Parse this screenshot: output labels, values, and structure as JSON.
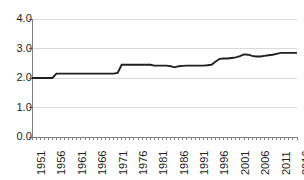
{
  "chart_data": {
    "type": "line",
    "title": "",
    "subtitle": "",
    "xlabel": "",
    "ylabel": "",
    "xlim": [
      1951,
      2016
    ],
    "ylim": [
      0.0,
      4.0
    ],
    "grid": "horizontal",
    "legend": "none",
    "line_color": "#231f20",
    "gridline_color": "#d9d9d9",
    "axis_color": "#808080",
    "y_ticks": [
      "0.0",
      "1.0",
      "2.0",
      "3.0",
      "4.0"
    ],
    "y_tick_values": [
      0.0,
      1.0,
      2.0,
      3.0,
      4.0
    ],
    "x_ticks": [
      "1951",
      "1956",
      "1961",
      "1966",
      "1971",
      "1976",
      "1981",
      "1986",
      "1991",
      "1996",
      "2001",
      "2006",
      "2011",
      "2016"
    ],
    "x_tick_values": [
      1951,
      1956,
      1961,
      1966,
      1971,
      1976,
      1981,
      1986,
      1991,
      1996,
      2001,
      2006,
      2011,
      2016
    ],
    "series": [
      {
        "name": "series-1",
        "x": [
          1951,
          1952,
          1953,
          1954,
          1955,
          1956,
          1957,
          1958,
          1959,
          1960,
          1961,
          1962,
          1963,
          1964,
          1965,
          1966,
          1967,
          1968,
          1969,
          1970,
          1971,
          1972,
          1973,
          1974,
          1975,
          1976,
          1977,
          1978,
          1979,
          1980,
          1981,
          1982,
          1983,
          1984,
          1985,
          1986,
          1987,
          1988,
          1989,
          1990,
          1991,
          1992,
          1993,
          1994,
          1995,
          1996,
          1997,
          1998,
          1999,
          2000,
          2001,
          2002,
          2003,
          2004,
          2005,
          2006,
          2007,
          2008,
          2009,
          2010,
          2011,
          2012,
          2013,
          2014,
          2015,
          2016
        ],
        "values": [
          2.0,
          2.0,
          2.0,
          2.0,
          2.0,
          2.0,
          2.15,
          2.15,
          2.15,
          2.15,
          2.15,
          2.15,
          2.15,
          2.15,
          2.15,
          2.15,
          2.15,
          2.15,
          2.15,
          2.15,
          2.15,
          2.17,
          2.45,
          2.45,
          2.45,
          2.45,
          2.45,
          2.45,
          2.45,
          2.45,
          2.42,
          2.42,
          2.42,
          2.42,
          2.4,
          2.36,
          2.4,
          2.41,
          2.42,
          2.42,
          2.42,
          2.42,
          2.42,
          2.43,
          2.45,
          2.55,
          2.65,
          2.66,
          2.66,
          2.68,
          2.7,
          2.74,
          2.8,
          2.79,
          2.75,
          2.73,
          2.73,
          2.75,
          2.77,
          2.79,
          2.82,
          2.85,
          2.85,
          2.85,
          2.85,
          2.85
        ]
      }
    ]
  }
}
